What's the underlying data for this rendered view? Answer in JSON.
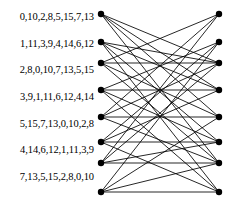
{
  "figure": {
    "type": "bipartite-graph",
    "background_color": "#ffffff",
    "edge_color": "#000000",
    "node_color": "#000000",
    "node_radius": 3.2,
    "edge_width": 0.85
  },
  "left_labels": [
    {
      "text": "0,10,2,8,5,15,7,13"
    },
    {
      "text": "1,11,3,9,4,14,6,12"
    },
    {
      "text": "2,8,0,10,7,13,5,15"
    },
    {
      "text": "3,9,1,11,6,12,4,14"
    },
    {
      "text": "5,15,7,13,0,10,2,8"
    },
    {
      "text": "4,14,6,12,1,11,3,9"
    },
    {
      "text": "7,13,5,15,2,8,0,10"
    }
  ],
  "label_positions_y": [
    17,
    44,
    70,
    97,
    124,
    150,
    177
  ],
  "left_nodes": [
    {
      "id": "L0",
      "x": 101,
      "y": 14
    },
    {
      "id": "L1",
      "x": 101,
      "y": 42
    },
    {
      "id": "L2",
      "x": 101,
      "y": 63
    },
    {
      "id": "L3",
      "x": 101,
      "y": 90
    },
    {
      "id": "L4",
      "x": 101,
      "y": 117
    },
    {
      "id": "L5",
      "x": 101,
      "y": 142
    },
    {
      "id": "L6",
      "x": 101,
      "y": 163
    },
    {
      "id": "L7",
      "x": 101,
      "y": 192
    }
  ],
  "right_nodes": [
    {
      "id": "R0",
      "x": 219,
      "y": 14
    },
    {
      "id": "R1",
      "x": 219,
      "y": 42
    },
    {
      "id": "R2",
      "x": 219,
      "y": 63
    },
    {
      "id": "R3",
      "x": 219,
      "y": 90
    },
    {
      "id": "R4",
      "x": 219,
      "y": 117
    },
    {
      "id": "R5",
      "x": 219,
      "y": 142
    },
    {
      "id": "R6",
      "x": 219,
      "y": 163
    },
    {
      "id": "R7",
      "x": 219,
      "y": 192
    }
  ],
  "edges": [
    {
      "from": 0,
      "to": 2
    },
    {
      "from": 0,
      "to": 3
    },
    {
      "from": 0,
      "to": 4
    },
    {
      "from": 0,
      "to": 6
    },
    {
      "from": 1,
      "to": 2
    },
    {
      "from": 1,
      "to": 3
    },
    {
      "from": 1,
      "to": 5
    },
    {
      "from": 1,
      "to": 7
    },
    {
      "from": 2,
      "to": 0
    },
    {
      "from": 2,
      "to": 2
    },
    {
      "from": 2,
      "to": 4
    },
    {
      "from": 2,
      "to": 6
    },
    {
      "from": 3,
      "to": 1
    },
    {
      "from": 3,
      "to": 3
    },
    {
      "from": 3,
      "to": 5
    },
    {
      "from": 3,
      "to": 7
    },
    {
      "from": 4,
      "to": 0
    },
    {
      "from": 4,
      "to": 2
    },
    {
      "from": 4,
      "to": 4
    },
    {
      "from": 4,
      "to": 6
    },
    {
      "from": 5,
      "to": 1
    },
    {
      "from": 5,
      "to": 3
    },
    {
      "from": 5,
      "to": 5
    },
    {
      "from": 5,
      "to": 7
    },
    {
      "from": 6,
      "to": 0
    },
    {
      "from": 6,
      "to": 2
    },
    {
      "from": 6,
      "to": 5
    },
    {
      "from": 6,
      "to": 6
    },
    {
      "from": 7,
      "to": 1
    },
    {
      "from": 7,
      "to": 4
    },
    {
      "from": 7,
      "to": 6
    },
    {
      "from": 7,
      "to": 7
    }
  ]
}
